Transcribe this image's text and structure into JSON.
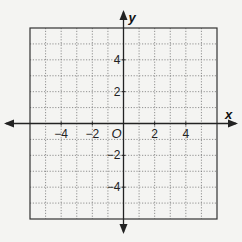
{
  "chart_data": {
    "type": "coordinate-grid",
    "title": "",
    "xlabel": "x",
    "ylabel": "y",
    "origin_label": "O",
    "xlim": [
      -6,
      6
    ],
    "ylim": [
      -6,
      6
    ],
    "grid": true,
    "grid_step": 1,
    "x_tick_labels": [
      {
        "value": -4,
        "label": "−4"
      },
      {
        "value": -2,
        "label": "−2"
      },
      {
        "value": 2,
        "label": "2"
      },
      {
        "value": 4,
        "label": "4"
      }
    ],
    "y_tick_labels": [
      {
        "value": 4,
        "label": "4"
      },
      {
        "value": 2,
        "label": "2"
      },
      {
        "value": -2,
        "label": "−2"
      },
      {
        "value": -4,
        "label": "−4"
      }
    ],
    "series": []
  },
  "colors": {
    "background": "#f4f4f2",
    "grid": "#777777",
    "axis": "#222222",
    "border": "#333333"
  }
}
